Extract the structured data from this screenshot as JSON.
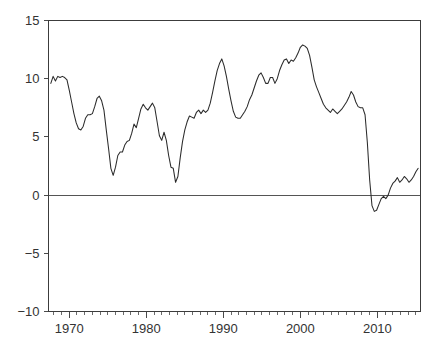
{
  "chart_data": {
    "type": "line",
    "title": "",
    "subtitle": "",
    "xlabel": "",
    "ylabel": "",
    "xlim": [
      1967.3,
      2015.6
    ],
    "ylim": [
      -10,
      15
    ],
    "grid": false,
    "legend": null,
    "zero_reference_line": 0,
    "y_ticks": [
      15,
      10,
      5,
      0,
      -5,
      -10
    ],
    "y_tick_labels": [
      "15",
      "10",
      "5",
      "0",
      "−5",
      "−10"
    ],
    "x_ticks": [
      1970,
      1980,
      1990,
      2000,
      2010
    ],
    "x_tick_labels": [
      "1970",
      "1980",
      "1990",
      "2000",
      "2010"
    ],
    "x_minor_tick_interval": 1,
    "line_color": "#2b2b2b",
    "axis_color": "#3c3c3c",
    "background_color": "#ffffff",
    "series": [
      {
        "name": "series-1",
        "x": [
          1967.6,
          1967.9,
          1968.2,
          1968.5,
          1968.8,
          1969.1,
          1969.4,
          1969.7,
          1970.0,
          1970.3,
          1970.6,
          1970.9,
          1971.2,
          1971.5,
          1971.8,
          1972.1,
          1972.4,
          1972.7,
          1973.0,
          1973.3,
          1973.6,
          1973.9,
          1974.2,
          1974.5,
          1974.8,
          1975.1,
          1975.4,
          1975.7,
          1976.0,
          1976.3,
          1976.6,
          1976.9,
          1977.2,
          1977.5,
          1977.8,
          1978.1,
          1978.4,
          1978.7,
          1979.0,
          1979.3,
          1979.6,
          1979.9,
          1980.2,
          1980.5,
          1980.8,
          1981.1,
          1981.4,
          1981.7,
          1982.0,
          1982.3,
          1982.6,
          1982.9,
          1983.2,
          1983.5,
          1983.8,
          1984.1,
          1984.4,
          1984.7,
          1985.0,
          1985.3,
          1985.6,
          1985.9,
          1986.2,
          1986.5,
          1986.8,
          1987.1,
          1987.4,
          1987.7,
          1988.0,
          1988.3,
          1988.6,
          1988.9,
          1989.2,
          1989.5,
          1989.8,
          1990.1,
          1990.4,
          1990.7,
          1991.0,
          1991.3,
          1991.6,
          1991.9,
          1992.2,
          1992.5,
          1992.8,
          1993.1,
          1993.4,
          1993.7,
          1994.0,
          1994.3,
          1994.6,
          1994.9,
          1995.2,
          1995.5,
          1995.8,
          1996.1,
          1996.4,
          1996.7,
          1997.0,
          1997.3,
          1997.6,
          1997.9,
          1998.2,
          1998.5,
          1998.8,
          1999.1,
          1999.4,
          1999.7,
          2000.0,
          2000.3,
          2000.6,
          2000.9,
          2001.2,
          2001.5,
          2001.8,
          2002.1,
          2002.4,
          2002.7,
          2003.0,
          2003.3,
          2003.6,
          2003.9,
          2004.2,
          2004.5,
          2004.8,
          2005.1,
          2005.4,
          2005.7,
          2006.0,
          2006.3,
          2006.6,
          2006.9,
          2007.2,
          2007.5,
          2007.8,
          2008.1,
          2008.4,
          2008.7,
          2009.0,
          2009.3,
          2009.6,
          2009.9,
          2010.2,
          2010.5,
          2010.8,
          2011.1,
          2011.4,
          2011.7,
          2012.0,
          2012.3,
          2012.6,
          2012.9,
          2013.2,
          2013.5,
          2013.8,
          2014.1,
          2014.4,
          2014.7,
          2015.0,
          2015.3
        ],
        "y": [
          9.6,
          10.2,
          9.8,
          10.2,
          10.1,
          10.2,
          10.1,
          9.9,
          9.0,
          8.0,
          7.0,
          6.2,
          5.7,
          5.6,
          5.9,
          6.6,
          6.9,
          6.9,
          7.0,
          7.6,
          8.3,
          8.5,
          8.1,
          7.3,
          5.6,
          4.0,
          2.3,
          1.7,
          2.4,
          3.4,
          3.7,
          3.7,
          4.3,
          4.6,
          4.7,
          5.3,
          6.1,
          5.8,
          6.6,
          7.4,
          7.8,
          7.5,
          7.3,
          7.6,
          7.9,
          7.5,
          6.3,
          5.1,
          4.7,
          5.4,
          4.7,
          3.4,
          2.4,
          2.3,
          1.1,
          1.6,
          3.2,
          4.6,
          5.6,
          6.3,
          6.8,
          6.7,
          6.6,
          7.1,
          7.3,
          7.0,
          7.3,
          7.1,
          7.3,
          7.9,
          8.8,
          9.8,
          10.7,
          11.3,
          11.7,
          11.1,
          10.2,
          9.1,
          8.1,
          7.2,
          6.7,
          6.6,
          6.6,
          6.9,
          7.2,
          7.6,
          8.2,
          8.6,
          9.2,
          9.8,
          10.3,
          10.5,
          10.1,
          9.6,
          9.6,
          10.1,
          10.1,
          9.6,
          10.0,
          10.7,
          11.2,
          11.6,
          11.7,
          11.3,
          11.6,
          11.5,
          11.8,
          12.2,
          12.7,
          12.9,
          12.8,
          12.6,
          12.0,
          11.0,
          9.9,
          9.3,
          8.8,
          8.3,
          7.8,
          7.5,
          7.3,
          7.1,
          7.4,
          7.2,
          7.0,
          7.2,
          7.4,
          7.7,
          8.0,
          8.4,
          8.9,
          8.6,
          8.0,
          7.6,
          7.5,
          7.5,
          6.9,
          4.5,
          1.3,
          -0.9,
          -1.4,
          -1.3,
          -0.8,
          -0.3,
          -0.1,
          -0.3,
          0.0,
          0.6,
          1.0,
          1.2,
          1.5,
          1.1,
          1.3,
          1.6,
          1.4,
          1.1,
          1.3,
          1.6,
          2.0,
          2.3
        ]
      }
    ]
  },
  "axes": {
    "y_axis_name": "value-axis",
    "x_axis_name": "time-axis"
  }
}
